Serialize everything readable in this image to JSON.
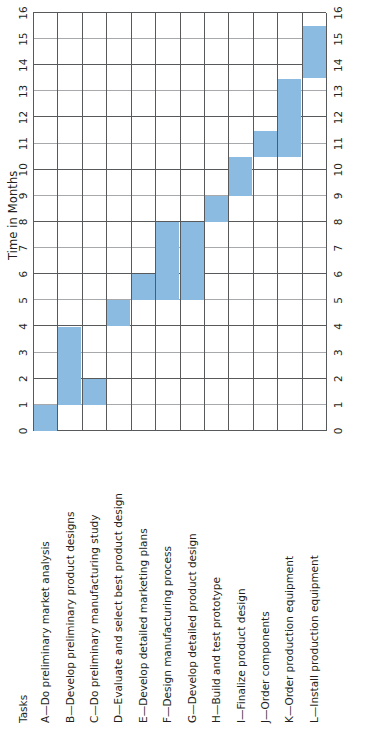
{
  "figure": {
    "tasks_header": "Tasks",
    "axis_title": "Time in Months",
    "bar_color": "#8cbbe1",
    "grid_color": "#58595b",
    "text_color": "#231f20"
  },
  "chart_data": {
    "type": "bar",
    "subtype": "gantt",
    "title": "",
    "xlabel": "Time in Months",
    "ylabel": "Tasks",
    "xlim": [
      0,
      16
    ],
    "grid": true,
    "legend": "none",
    "orientation": "rotated-90",
    "xticks": [
      "0",
      "1",
      "2",
      "3",
      "4",
      "5",
      "6",
      "7",
      "8",
      "9",
      "10",
      "11",
      "12",
      "13",
      "14",
      "15",
      "16"
    ],
    "xtick_values": [
      0,
      1,
      2,
      3,
      4,
      5,
      6,
      7,
      8,
      9,
      10,
      11,
      12,
      13,
      14,
      15,
      16
    ],
    "categories": [
      "A—Do preliminary market analysis",
      "B—Develop preliminary product designs",
      "C—Do preliminary manufacturing study",
      "D—Evaluate and select best product design",
      "E—Develop detailed marketing plans",
      "F—Design manufacturing process",
      "G—Develop detailed product design",
      "H—Build and test prototype",
      "I—Finalize product design",
      "J—Order components",
      "K—Order production equipment",
      "L—Install production equipment"
    ],
    "bars": [
      {
        "task": "A",
        "label": "A—Do preliminary market analysis",
        "start": 0,
        "end": 1,
        "duration": 1
      },
      {
        "task": "B",
        "label": "B—Develop preliminary product designs",
        "start": 1,
        "end": 4,
        "duration": 3
      },
      {
        "task": "C",
        "label": "C—Do preliminary manufacturing study",
        "start": 1,
        "end": 2,
        "duration": 1
      },
      {
        "task": "D",
        "label": "D—Evaluate and select best product design",
        "start": 4,
        "end": 5,
        "duration": 1
      },
      {
        "task": "E",
        "label": "E—Develop detailed marketing plans",
        "start": 5,
        "end": 6,
        "duration": 1
      },
      {
        "task": "F",
        "label": "F—Design manufacturing process",
        "start": 5,
        "end": 8,
        "duration": 3
      },
      {
        "task": "G",
        "label": "G—Develop detailed product design",
        "start": 5,
        "end": 8,
        "duration": 3
      },
      {
        "task": "H",
        "label": "H—Build and test prototype",
        "start": 8,
        "end": 9,
        "duration": 1
      },
      {
        "task": "I",
        "label": "I—Finalize product design",
        "start": 9,
        "end": 10.5,
        "duration": 1.5
      },
      {
        "task": "J",
        "label": "J—Order components",
        "start": 10.5,
        "end": 11.5,
        "duration": 1
      },
      {
        "task": "K",
        "label": "K—Order production equipment",
        "start": 10.5,
        "end": 13.5,
        "duration": 3
      },
      {
        "task": "L",
        "label": "L—Install production equipment",
        "start": 13.5,
        "end": 15.5,
        "duration": 2
      }
    ]
  }
}
